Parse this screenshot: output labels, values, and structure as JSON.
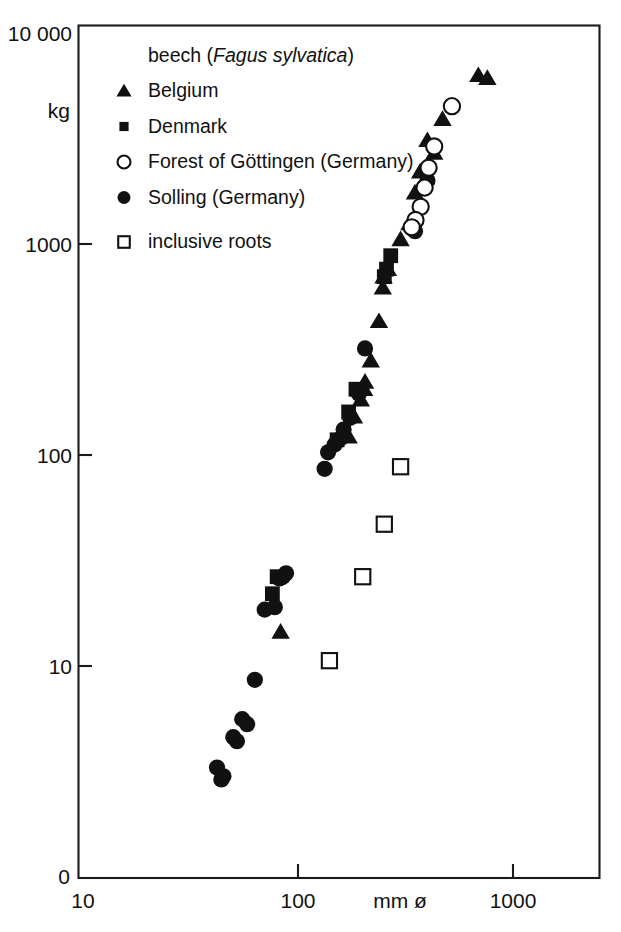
{
  "chart_data": {
    "type": "scatter",
    "title": "beech (Fagus sylvatica)",
    "title_plain": "beech",
    "title_species": "Fagus sylvatica",
    "xlabel": "mm ø",
    "ylabel": "kg",
    "xscale": "log",
    "yscale": "log",
    "xlim": [
      10,
      2000
    ],
    "ylim": [
      3,
      10000
    ],
    "grid": false,
    "legend_position": "top-left inside plot",
    "xticks": [
      {
        "value": 10,
        "label": "10"
      },
      {
        "value": 100,
        "label": "100"
      },
      {
        "value": 1000,
        "label": "1000"
      }
    ],
    "yticks": [
      {
        "value": 10000,
        "label": "10 000"
      },
      {
        "value": 1000,
        "label": "1000"
      },
      {
        "value": 100,
        "label": "100"
      },
      {
        "value": 10,
        "label": "10"
      },
      {
        "value": 0,
        "label": "0"
      }
    ],
    "origin_label": "0",
    "series": [
      {
        "name": "Belgium",
        "marker": "filled-triangle",
        "color": "#111111",
        "points": [
          [
            690,
            6300
          ],
          [
            760,
            6100
          ],
          [
            470,
            3900
          ],
          [
            400,
            3100
          ],
          [
            430,
            2700
          ],
          [
            370,
            2200
          ],
          [
            350,
            1750
          ],
          [
            330,
            1250
          ],
          [
            300,
            1050
          ],
          [
            262,
            760
          ],
          [
            250,
            700
          ],
          [
            248,
            620
          ],
          [
            238,
            430
          ],
          [
            218,
            280
          ],
          [
            205,
            222
          ],
          [
            203,
            205
          ],
          [
            196,
            183
          ],
          [
            182,
            152
          ],
          [
            172,
            122
          ],
          [
            83,
            14.5
          ]
        ]
      },
      {
        "name": "Denmark",
        "marker": "filled-square",
        "color": "#111111",
        "points": [
          [
            270,
            880
          ],
          [
            258,
            760
          ],
          [
            252,
            700
          ],
          [
            186,
            205
          ],
          [
            172,
            160
          ],
          [
            152,
            118
          ],
          [
            80,
            26.5
          ],
          [
            76,
            22.0
          ]
        ]
      },
      {
        "name": "Forest of Göttingen (Germany)",
        "marker": "open-circle",
        "color": "#ffffff",
        "points": [
          [
            520,
            4500
          ],
          [
            430,
            2900
          ],
          [
            405,
            2300
          ],
          [
            388,
            1850
          ],
          [
            372,
            1500
          ],
          [
            352,
            1300
          ],
          [
            338,
            1200
          ]
        ]
      },
      {
        "name": "Solling (Germany)",
        "marker": "filled-circle",
        "color": "#111111",
        "points": [
          [
            400,
            2000
          ],
          [
            350,
            1150
          ],
          [
            192,
            195
          ],
          [
            205,
            320
          ],
          [
            175,
            150
          ],
          [
            163,
            132
          ],
          [
            158,
            120
          ],
          [
            148,
            112
          ],
          [
            138,
            103
          ],
          [
            133,
            86
          ],
          [
            88,
            27.5
          ],
          [
            85,
            26.5
          ],
          [
            82,
            26.0
          ],
          [
            70,
            18.5
          ],
          [
            78,
            19.0
          ],
          [
            63,
            8.6
          ],
          [
            55,
            5.6
          ],
          [
            58,
            5.3
          ],
          [
            50,
            4.6
          ],
          [
            52,
            4.4
          ],
          [
            42,
            3.3
          ],
          [
            45,
            3.0
          ],
          [
            44,
            2.9
          ]
        ]
      },
      {
        "name": "inclusive roots",
        "marker": "open-square",
        "color": "#ffffff",
        "points": [
          [
            300,
            88
          ],
          [
            252,
            47
          ],
          [
            200,
            26.5
          ],
          [
            140,
            10.6
          ]
        ]
      }
    ]
  },
  "legend": {
    "header_plain": "beech (",
    "header_species": "Fagus sylvatica",
    "header_close": ")",
    "items": [
      {
        "label": "Belgium",
        "marker": "filled-triangle"
      },
      {
        "label": "Denmark",
        "marker": "filled-square"
      },
      {
        "label": "Forest of Göttingen (Germany)",
        "marker": "open-circle"
      },
      {
        "label": "Solling (Germany)",
        "marker": "filled-circle"
      },
      {
        "label": "inclusive roots",
        "marker": "open-square"
      }
    ]
  }
}
